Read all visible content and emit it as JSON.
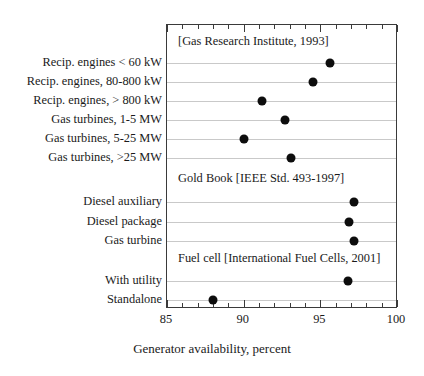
{
  "chart_data": {
    "type": "scatter",
    "title": "",
    "xlabel": "Generator availability, percent",
    "ylabel": "",
    "xlim": [
      85,
      100
    ],
    "xticks": [
      85,
      90,
      95,
      100
    ],
    "xtick_labels": [
      "85",
      "90",
      "95",
      "100"
    ],
    "minor_tick_step": 1,
    "grid": "horizontal-rows-only",
    "legend": "none",
    "orientation": "horizontal-dot-plot",
    "sections": [
      {
        "header": "[Gas Research Institute, 1993]",
        "categories": [
          "Recip. engines < 60 kW",
          "Recip. engines, 80-800 kW",
          "Recip. engines, > 800 kW",
          "Gas turbines, 1-5 MW",
          "Gas turbines, 5-25 MW",
          "Gas turbines, >25 MW"
        ],
        "values": [
          95.6,
          94.5,
          91.2,
          92.7,
          90.0,
          93.1
        ]
      },
      {
        "header": "Gold Book [IEEE Std. 493-1997]",
        "categories": [
          "Diesel auxiliary",
          "Diesel package",
          "Gas turbine"
        ],
        "values": [
          97.2,
          96.9,
          97.2
        ]
      },
      {
        "header": "Fuel cell [International Fuel Cells, 2001]",
        "categories": [
          "With utility",
          "Standalone"
        ],
        "values": [
          96.8,
          88.0
        ]
      }
    ],
    "marker_color": "#0d0d0d",
    "gridline_color": "#c9c9c9",
    "frame_color": "#3a3a3a"
  }
}
